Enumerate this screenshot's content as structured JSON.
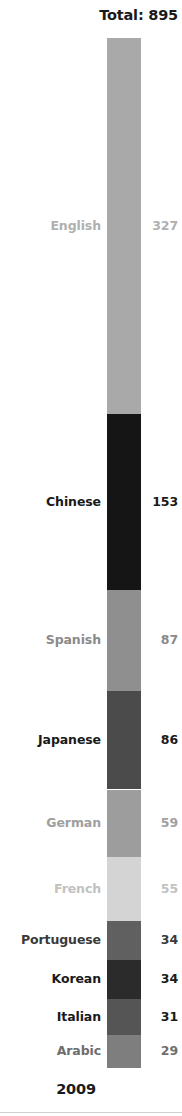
{
  "header": {
    "total_label": "Total: 895"
  },
  "footer": {
    "year_label": "2009"
  },
  "chart_data": {
    "type": "bar",
    "orientation": "vertical-stacked",
    "title": "Total: 895",
    "subtitle": "2009",
    "xlabel": "",
    "ylabel": "",
    "total": 895,
    "categories": [
      "English",
      "Chinese",
      "Spanish",
      "Japanese",
      "German",
      "French",
      "Portuguese",
      "Korean",
      "Italian",
      "Arabic"
    ],
    "values": [
      327,
      153,
      87,
      86,
      59,
      55,
      34,
      34,
      31,
      29
    ],
    "series": [
      {
        "name": "2009",
        "values": [
          327,
          153,
          87,
          86,
          59,
          55,
          34,
          34,
          31,
          29
        ]
      }
    ],
    "segments": [
      {
        "label": "English",
        "value": "327",
        "number": 327,
        "color": "#a9a9a9",
        "text_color": "#b0b0b0"
      },
      {
        "label": "Chinese",
        "value": "153",
        "number": 153,
        "color": "#151515",
        "text_color": "#1a1a1a"
      },
      {
        "label": "Spanish",
        "value": "87",
        "number": 87,
        "color": "#8f8f8f",
        "text_color": "#8a8a8a"
      },
      {
        "label": "Japanese",
        "value": "86",
        "number": 86,
        "color": "#4b4b4b",
        "text_color": "#1a1a1a"
      },
      {
        "label": "German",
        "value": "59",
        "number": 59,
        "color": "#9d9d9d",
        "text_color": "#a0a0a0"
      },
      {
        "label": "French",
        "value": "55",
        "number": 55,
        "color": "#d4d4d4",
        "text_color": "#c2c2c2"
      },
      {
        "label": "Portuguese",
        "value": "34",
        "number": 34,
        "color": "#606060",
        "text_color": "#3a3a3a"
      },
      {
        "label": "Korean",
        "value": "34",
        "number": 34,
        "color": "#2b2b2b",
        "text_color": "#1a1a1a"
      },
      {
        "label": "Italian",
        "value": "31",
        "number": 31,
        "color": "#555555",
        "text_color": "#1a1a1a"
      },
      {
        "label": "Arabic",
        "value": "29",
        "number": 29,
        "color": "#7e7e7e",
        "text_color": "#6e6e6e"
      }
    ],
    "grid": false,
    "legend": "inline-labels",
    "axis_visible": false
  }
}
